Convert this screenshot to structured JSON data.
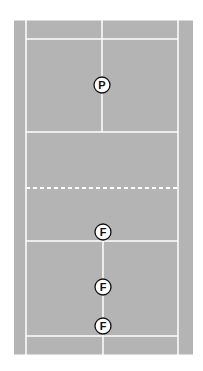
{
  "diagram": {
    "type": "badminton-court-positions",
    "colors": {
      "court": "#b4b4b4",
      "lines": "#ffffff",
      "background": "#ffffff",
      "marker_fill": "#ffffff",
      "marker_stroke": "#111111",
      "marker_text": "#111111"
    },
    "court": {
      "x": 14,
      "y": 20,
      "width": 179,
      "height": 335
    },
    "lines": {
      "left_sideline_x": 26,
      "right_sideline_x": 178,
      "center_x": 102,
      "top_back_service_y": 39,
      "top_short_service_y": 132,
      "net_y": 188,
      "bottom_short_service_y": 241,
      "bottom_back_service_y": 336
    },
    "net": {
      "style": "dashed",
      "dash": 4,
      "gap": 3
    },
    "markers": [
      {
        "label": "P",
        "x": 102,
        "y": 85
      },
      {
        "label": "F",
        "x": 103,
        "y": 232
      },
      {
        "label": "F",
        "x": 103,
        "y": 287
      },
      {
        "label": "F",
        "x": 103,
        "y": 326
      }
    ],
    "marker_radius": 8
  }
}
